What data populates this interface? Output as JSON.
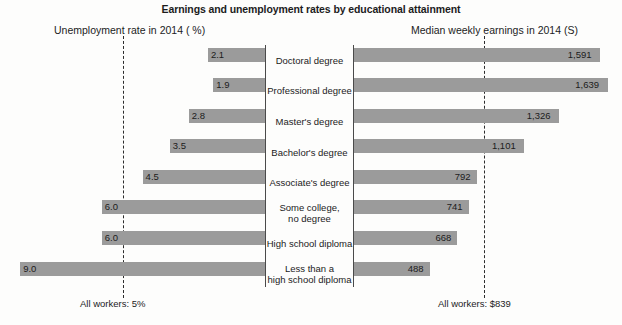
{
  "chart_data": {
    "type": "bar",
    "title": "Earnings and unemployment rates by educational attainment",
    "left_panel_label": "Unemployment rate in 2014 ( %)",
    "right_panel_label": "Median weekly earnings in 2014 (S)",
    "categories": [
      "Doctoral degree",
      "Professional degree",
      "Master's degree",
      "Bachelor's degree",
      "Associate's degree",
      "Some college,\nno degree",
      "High school diploma",
      "Less than a\nhigh school diploma"
    ],
    "series": [
      {
        "name": "Unemployment rate in 2014 ( %)",
        "side": "left",
        "unit": "percent",
        "values": [
          2.1,
          1.9,
          2.8,
          3.5,
          4.5,
          6.0,
          6.0,
          9.0
        ],
        "value_labels": [
          "2.1",
          "1.9",
          "2.8",
          "3.5",
          "4.5",
          "6.0",
          "6.0",
          "9.0"
        ]
      },
      {
        "name": "Median weekly earnings in 2014 (S)",
        "side": "right",
        "unit": "dollars",
        "values": [
          1591,
          1639,
          1326,
          1101,
          792,
          741,
          668,
          488
        ],
        "value_labels": [
          "1,591",
          "1,639",
          "1,326",
          "1,101",
          "792",
          "741",
          "668",
          "488"
        ]
      }
    ],
    "reference_lines": [
      {
        "side": "left",
        "label": "All workers: 5%",
        "value": 5,
        "style": "dashed"
      },
      {
        "side": "right",
        "label": "All workers: $839",
        "value": 839,
        "style": "dashed"
      }
    ],
    "grid": false,
    "legend": "none",
    "bar_color": "#9b9b9b",
    "axis_color": "#4a4a4a",
    "text_color": "#1b1b1b",
    "background": "#fdfdfc"
  },
  "footer": {
    "left": "All workers: 5%",
    "right": "All workers: $839",
    "clipped_caption": ""
  }
}
